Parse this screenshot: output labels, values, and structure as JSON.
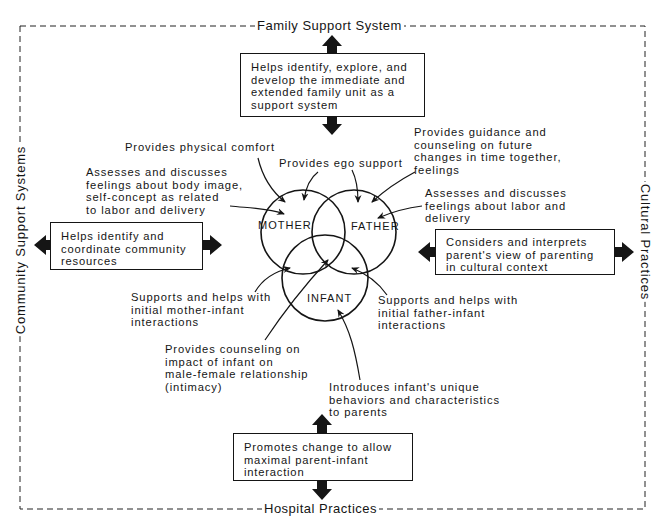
{
  "frame": {
    "top_label": "Family Support System",
    "bottom_label": "Hospital Practices",
    "left_label": "Community Support Systems",
    "right_label": "Cultural Practices"
  },
  "boxes": {
    "top": [
      "Helps identify, explore, and",
      "develop the immediate and",
      "extended family unit as a",
      "support system"
    ],
    "left": [
      "Helps identify and",
      "coordinate community",
      "resources"
    ],
    "right": [
      "Considers and interprets",
      "parent's view of parenting",
      "in cultural context"
    ],
    "bottom": [
      "Promotes change to allow",
      "maximal parent-infant",
      "interaction"
    ]
  },
  "circles": {
    "mother": "MOTHER",
    "father": "FATHER",
    "infant": "INFANT"
  },
  "annotations": {
    "physical_comfort": [
      "Provides physical comfort"
    ],
    "ego_support": [
      "Provides ego support"
    ],
    "body_image": [
      "Assesses and discusses",
      "feelings about body image,",
      "self-concept as related",
      "to labor and delivery"
    ],
    "guidance": [
      "Provides guidance and",
      "counseling on future",
      "changes in time together,",
      "feelings"
    ],
    "father_labor": [
      "Assesses and discusses",
      "feelings about labor and",
      "delivery"
    ],
    "mother_infant": [
      "Supports and helps with",
      "initial mother-infant",
      "interactions"
    ],
    "father_infant": [
      "Supports and helps with",
      "initial father-infant",
      "interactions"
    ],
    "intimacy": [
      "Provides counseling on",
      "impact of infant on",
      "male-female relationship",
      "(intimacy)"
    ],
    "infant_behaviors": [
      "Introduces infant's unique",
      "behaviors and characteristics",
      "to parents"
    ]
  },
  "colors": {
    "ink": "#151515",
    "background": "#ffffff"
  }
}
